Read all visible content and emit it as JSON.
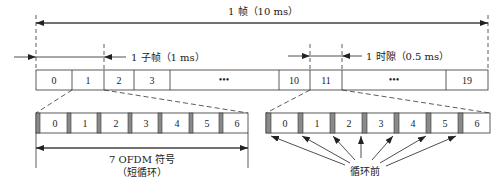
{
  "labels": {
    "frame": "1 帧（10 ms）",
    "subframe": "1 子帧（1 ms）",
    "slot": "1 时隙（0.5 ms）",
    "ofdm_line1": "7 OFDM 符号",
    "ofdm_line2": "（短循环）",
    "cyclic_prefix": "循环前"
  },
  "frame_row": {
    "cells": [
      "0",
      "1",
      "2",
      "3",
      "•••",
      "10",
      "11",
      "•••",
      "19"
    ]
  },
  "slot_left": {
    "symbols": [
      "0",
      "1",
      "2",
      "3",
      "4",
      "5",
      "6"
    ]
  },
  "slot_right": {
    "symbols": [
      "0",
      "1",
      "2",
      "3",
      "4",
      "5",
      "6"
    ]
  },
  "colors": {
    "line": "#333333",
    "cp_fill": "#8a8a8a"
  }
}
